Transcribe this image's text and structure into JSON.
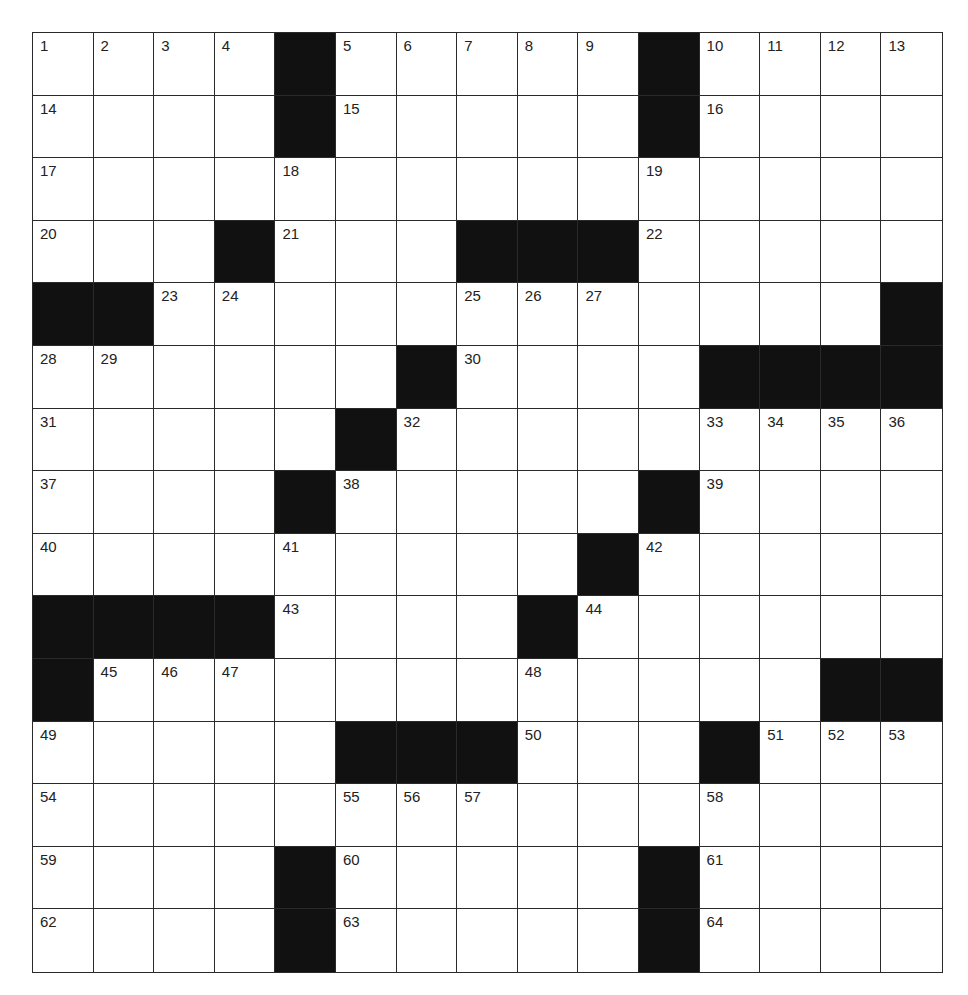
{
  "puzzle": {
    "rows": 15,
    "cols": 15,
    "colors": {
      "block": "#111111",
      "cell": "#ffffff",
      "line": "#2a2a2a",
      "number": "#222222"
    },
    "grid": [
      [
        "1",
        "2",
        "3",
        "4",
        "#",
        "5",
        "6",
        "7",
        "8",
        "9",
        "#",
        "10",
        "11",
        "12",
        "13"
      ],
      [
        "14",
        "",
        "",
        "",
        "#",
        "15",
        "",
        "",
        "",
        "",
        "#",
        "16",
        "",
        "",
        ""
      ],
      [
        "17",
        "",
        "",
        "",
        "18",
        "",
        "",
        "",
        "",
        "",
        "19",
        "",
        "",
        "",
        ""
      ],
      [
        "20",
        "",
        "",
        "#",
        "21",
        "",
        "",
        "#",
        "#",
        "#",
        "22",
        "",
        "",
        "",
        ""
      ],
      [
        "#",
        "#",
        "23",
        "24",
        "",
        "",
        "",
        "25",
        "26",
        "27",
        "",
        "",
        "",
        "",
        "#"
      ],
      [
        "28",
        "29",
        "",
        "",
        "",
        "",
        "#",
        "30",
        "",
        "",
        "",
        "#",
        "#",
        "#",
        "#"
      ],
      [
        "31",
        "",
        "",
        "",
        "",
        "#",
        "32",
        "",
        "",
        "",
        "",
        "33",
        "34",
        "35",
        "36"
      ],
      [
        "37",
        "",
        "",
        "",
        "#",
        "38",
        "",
        "",
        "",
        "",
        "#",
        "39",
        "",
        "",
        ""
      ],
      [
        "40",
        "",
        "",
        "",
        "41",
        "",
        "",
        "",
        "",
        "#",
        "42",
        "",
        "",
        "",
        ""
      ],
      [
        "#",
        "#",
        "#",
        "#",
        "43",
        "",
        "",
        "",
        "#",
        "44",
        "",
        "",
        "",
        "",
        ""
      ],
      [
        "#",
        "45",
        "46",
        "47",
        "",
        "",
        "",
        "",
        "48",
        "",
        "",
        "",
        "",
        "#",
        "#"
      ],
      [
        "49",
        "",
        "",
        "",
        "",
        "#",
        "#",
        "#",
        "50",
        "",
        "",
        "#",
        "51",
        "52",
        "53"
      ],
      [
        "54",
        "",
        "",
        "",
        "",
        "55",
        "56",
        "57",
        "",
        "",
        "",
        "58",
        "",
        "",
        ""
      ],
      [
        "59",
        "",
        "",
        "",
        "#",
        "60",
        "",
        "",
        "",
        "",
        "#",
        "61",
        "",
        "",
        ""
      ],
      [
        "62",
        "",
        "",
        "",
        "#",
        "63",
        "",
        "",
        "",
        "",
        "#",
        "64",
        "",
        "",
        ""
      ]
    ]
  }
}
